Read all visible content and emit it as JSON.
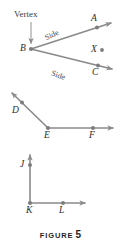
{
  "figure": {
    "caption_word": "FIGURE",
    "caption_number": "5",
    "stroke_color": "#8a8a8a",
    "label_color": "#2b2b2b",
    "background": "#ffffff"
  },
  "annotations": {
    "vertex_label": "Vertex",
    "side_label_upper": "Side",
    "side_label_lower": "Side"
  },
  "diagrams": [
    {
      "name": "angle-ABC",
      "vertex": "B",
      "points": [
        {
          "label": "A",
          "x": 97,
          "y": 27
        },
        {
          "label": "B",
          "x": 31,
          "y": 49
        },
        {
          "label": "C",
          "x": 98,
          "y": 72
        },
        {
          "label": "X",
          "x": 102,
          "y": 50
        }
      ],
      "rays": [
        {
          "from": "B",
          "through": "A",
          "arrow": true
        },
        {
          "from": "B",
          "through": "C",
          "arrow": true
        }
      ]
    },
    {
      "name": "angle-DEF",
      "vertex": "E",
      "points": [
        {
          "label": "D",
          "x": 21,
          "y": 103
        },
        {
          "label": "E",
          "x": 48,
          "y": 128
        },
        {
          "label": "F",
          "x": 93,
          "y": 128
        }
      ],
      "rays": [
        {
          "from": "E",
          "through": "D",
          "arrow": true
        },
        {
          "from": "E",
          "through": "F",
          "arrow": true
        }
      ]
    },
    {
      "name": "angle-JKL",
      "vertex": "K",
      "points": [
        {
          "label": "J",
          "x": 30,
          "y": 165
        },
        {
          "label": "K",
          "x": 30,
          "y": 203
        },
        {
          "label": "L",
          "x": 63,
          "y": 203
        }
      ],
      "rays": [
        {
          "from": "K",
          "through": "J",
          "arrow": true
        },
        {
          "from": "K",
          "through": "L",
          "arrow": true
        }
      ]
    }
  ],
  "point_labels": {
    "A": "A",
    "B": "B",
    "C": "C",
    "X": "X",
    "D": "D",
    "E": "E",
    "F": "F",
    "J": "J",
    "K": "K",
    "L": "L"
  }
}
